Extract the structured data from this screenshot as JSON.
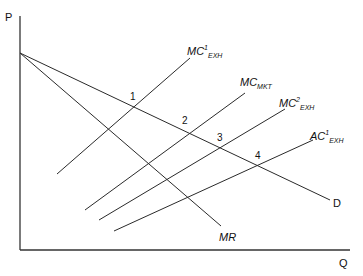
{
  "axes": {
    "y_label": "P",
    "x_label": "Q"
  },
  "curves": {
    "demand": {
      "label": "D"
    },
    "marginal_revenue": {
      "label": "MR"
    },
    "mc1_exh": {
      "main": "MC",
      "sup": "1",
      "sub": "EXH"
    },
    "mc_mkt": {
      "main": "MC",
      "sub": "MKT"
    },
    "mc2_exh": {
      "main": "MC",
      "sup": "2",
      "sub": "EXH"
    },
    "ac1_exh": {
      "main": "AC",
      "sup": "1",
      "sub": "EXH"
    }
  },
  "points": [
    {
      "label": "1"
    },
    {
      "label": "2"
    },
    {
      "label": "3"
    },
    {
      "label": "4"
    }
  ],
  "colors": {
    "line": "#2a2a2a",
    "background": "#ffffff"
  }
}
